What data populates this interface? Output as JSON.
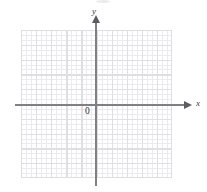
{
  "figure": {
    "kind": "coordinate-plane",
    "axis_labels": {
      "x": "x",
      "y": "y"
    },
    "origin_label": "0",
    "colors": {
      "background": "#ffffff",
      "axis": "#7f7f84",
      "arrowhead": "#5d5d62",
      "grid_major": "#dedee3",
      "grid_minor": "#e9e9ee",
      "label_text": "#3a3a3f"
    }
  },
  "chart_data": {
    "type": "scatter",
    "title": "",
    "subtitle": "",
    "xlabel": "x",
    "ylabel": "y",
    "origin_label": "0",
    "xlim": [
      -5,
      5
    ],
    "ylim": [
      -5,
      5
    ],
    "xticks": [
      -5,
      -4,
      -3,
      -2,
      -1,
      0,
      1,
      2,
      3,
      4,
      5
    ],
    "yticks": [
      -5,
      -4,
      -3,
      -2,
      -1,
      0,
      1,
      2,
      3,
      4,
      5
    ],
    "xtick_labels": [
      "",
      "",
      "",
      "",
      "",
      "0",
      "",
      "",
      "",
      "",
      ""
    ],
    "ytick_labels": [
      "",
      "",
      "",
      "",
      "",
      "",
      "",
      "",
      "",
      "",
      ""
    ],
    "grid": true,
    "grid_major_cells_x": 10,
    "grid_major_cells_y": 10,
    "grid_minor_subdivisions": 3,
    "legend": null,
    "legend_position": "none",
    "series": [],
    "annotations": []
  }
}
